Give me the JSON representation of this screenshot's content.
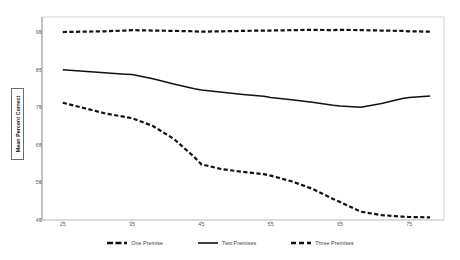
{
  "chart_data": {
    "type": "line",
    "title": "",
    "subtitle": "",
    "xlabel": "",
    "ylabel": "Mean Percent Correct",
    "x": [
      25,
      28,
      31,
      34,
      35,
      38,
      41,
      44,
      45,
      48,
      51,
      54,
      55,
      58,
      61,
      64,
      65,
      68,
      71,
      74,
      75,
      78
    ],
    "xticks": [
      25,
      35,
      45,
      55,
      65,
      75
    ],
    "xticklabels": [
      "25",
      "35",
      "45",
      "55",
      "65",
      "75"
    ],
    "yticks": [
      45,
      55,
      65,
      75,
      85,
      95
    ],
    "yticklabels": [
      "45",
      "55",
      "65",
      "75",
      "85",
      "95"
    ],
    "xlim": [
      22,
      80
    ],
    "ylim": [
      45,
      99
    ],
    "grid": false,
    "legend_position": "bottom",
    "series": [
      {
        "name": "One Premise",
        "label": "One Premise",
        "style": "dashed",
        "color": "#111111",
        "values": [
          95.0,
          95.1,
          95.2,
          95.4,
          95.5,
          95.4,
          95.3,
          95.2,
          95.1,
          95.2,
          95.3,
          95.4,
          95.4,
          95.5,
          95.6,
          95.5,
          95.6,
          95.5,
          95.4,
          95.3,
          95.2,
          95.1
        ]
      },
      {
        "name": "Two Premises",
        "label": "Two Premises",
        "style": "solid",
        "color": "#111111",
        "values": [
          85.0,
          84.6,
          84.2,
          83.8,
          83.7,
          82.6,
          81.2,
          79.9,
          79.6,
          79.0,
          78.4,
          77.9,
          77.6,
          77.0,
          76.3,
          75.5,
          75.3,
          75.0,
          76.0,
          77.3,
          77.6,
          78.0
        ]
      },
      {
        "name": "Three Premises",
        "label": "Three Premises",
        "style": "dashed",
        "color": "#111111",
        "values": [
          76.2,
          74.8,
          73.4,
          72.4,
          72.1,
          70.0,
          66.6,
          61.7,
          59.8,
          58.5,
          57.8,
          57.2,
          56.8,
          55.3,
          53.3,
          50.6,
          49.8,
          47.2,
          46.3,
          45.9,
          45.8,
          45.7
        ]
      }
    ]
  },
  "legend": {
    "items": [
      {
        "label": "One Premise",
        "style": "dashed"
      },
      {
        "label": "Two Premises",
        "style": "solid"
      },
      {
        "label": "Three Premises",
        "style": "dashed-long"
      }
    ]
  }
}
